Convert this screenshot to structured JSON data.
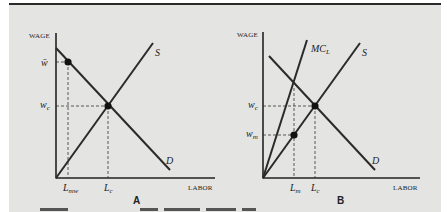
{
  "figure": {
    "panels": [
      {
        "id": "A",
        "label": "A",
        "y_axis_label": "WAGE",
        "x_axis_label": "LABOR",
        "curves": [
          {
            "name": "S",
            "label": "S",
            "type": "supply"
          },
          {
            "name": "D",
            "label": "D",
            "type": "demand"
          }
        ],
        "y_ticks": [
          {
            "label": "w̄",
            "meaning": "minimum wage"
          },
          {
            "label": "w",
            "sub": "c"
          }
        ],
        "x_ticks": [
          {
            "label": "L",
            "sub": "mw"
          },
          {
            "label": "L",
            "sub": "c"
          }
        ],
        "points": [
          "(L_mw, w̄)",
          "(L_c, w_c)"
        ]
      },
      {
        "id": "B",
        "label": "B",
        "y_axis_label": "WAGE",
        "x_axis_label": "LABOR",
        "curves": [
          {
            "name": "MC_L",
            "label": "MC",
            "sub": "L",
            "type": "marginal-cost"
          },
          {
            "name": "S",
            "label": "S",
            "type": "supply"
          },
          {
            "name": "D",
            "label": "D",
            "type": "demand"
          }
        ],
        "y_ticks": [
          {
            "label": "w",
            "sub": "c"
          },
          {
            "label": "w",
            "sub": "m"
          }
        ],
        "x_ticks": [
          {
            "label": "L",
            "sub": "m"
          },
          {
            "label": "L",
            "sub": "c"
          }
        ],
        "points": [
          "(L_m, w_m)",
          "(L_c, w_c)"
        ]
      }
    ]
  },
  "labels": {
    "a_wage": "WAGE",
    "a_labor": "LABOR",
    "a_s": "S",
    "a_d": "D",
    "a_wbar": "w̄",
    "a_wc_main": "w",
    "a_wc_sub": "c",
    "a_lmw_main": "L",
    "a_lmw_sub": "mw",
    "a_lc_main": "L",
    "a_lc_sub": "c",
    "a_panel": "A",
    "b_wage": "WAGE",
    "b_labor": "LABOR",
    "b_s": "S",
    "b_d": "D",
    "b_mc_main": "MC",
    "b_mc_sub": "L",
    "b_wc_main": "w",
    "b_wc_sub": "c",
    "b_wm_main": "w",
    "b_wm_sub": "m",
    "b_lm_main": "L",
    "b_lm_sub": "m",
    "b_lc_main": "L",
    "b_lc_sub": "c",
    "b_panel": "B"
  },
  "colors": {
    "panel_bg": "#e4e4e2",
    "ink": "#222222"
  }
}
